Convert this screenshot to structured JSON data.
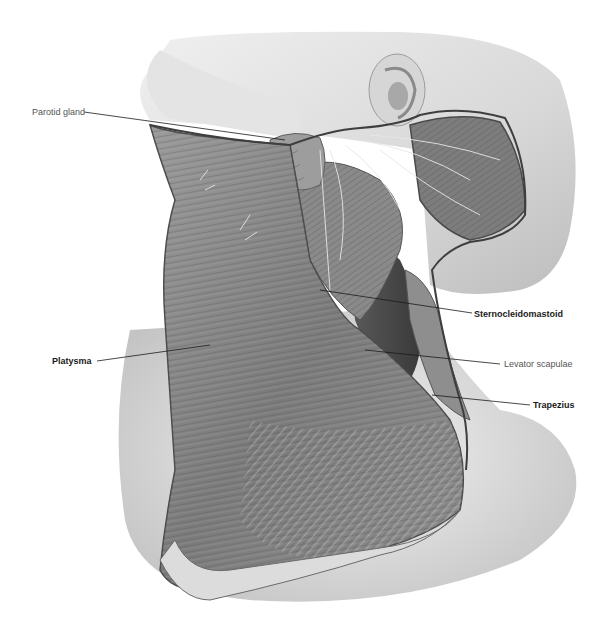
{
  "figure": {
    "colors": {
      "background": "#ffffff",
      "skin_light": "#e6e6e6",
      "skin_mid": "#cfcfcf",
      "muscle_dark": "#6a6a6a",
      "muscle_mid": "#8a8a8a",
      "leader_line": "#1a1a1a",
      "label_regular": "#555555",
      "label_bold": "#1a1a1a"
    }
  },
  "labels": [
    {
      "id": "parotid-gland",
      "text": "Parotid gland",
      "weight": "regular",
      "x": 32,
      "y": 108,
      "line": [
        84,
        112,
        285,
        140
      ]
    },
    {
      "id": "platysma",
      "text": "Platysma",
      "weight": "bold",
      "x": 52,
      "y": 357,
      "line": [
        97,
        361,
        210,
        345
      ]
    },
    {
      "id": "sternocleidomastoid",
      "text": "Sternocleidomastoid",
      "weight": "bold",
      "x": 474,
      "y": 310,
      "line": [
        472,
        313,
        320,
        290
      ]
    },
    {
      "id": "levator-scapulae",
      "text": "Levator scapulae",
      "weight": "regular",
      "x": 504,
      "y": 360,
      "line": [
        500,
        364,
        365,
        350
      ]
    },
    {
      "id": "trapezius",
      "text": "Trapezius",
      "weight": "bold",
      "x": 533,
      "y": 401,
      "line": [
        530,
        405,
        432,
        395
      ]
    }
  ]
}
